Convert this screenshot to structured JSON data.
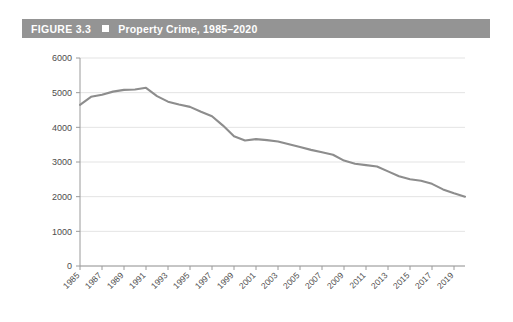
{
  "figure": {
    "number_label": "FIGURE 3.3",
    "bullet_icon": "square-bullet-icon",
    "title": "Property Crime, 1985–2020"
  },
  "colors": {
    "title_bar_background": "#949494",
    "title_text": "#ffffff",
    "line": "#8d8d8d",
    "gridline": "#dcdcdc",
    "axis": "#9a9a9a",
    "tick_text": "#4d4d4d",
    "page_background": "#ffffff"
  },
  "chart_data": {
    "type": "line",
    "title": "Property Crime, 1985–2020",
    "xlabel": "",
    "ylabel": "",
    "ylim": [
      0,
      6000
    ],
    "xlim": [
      1985,
      2020
    ],
    "ytick_values": [
      0,
      1000,
      2000,
      3000,
      4000,
      5000,
      6000
    ],
    "ytick_labels": [
      "0",
      "1000",
      "2000",
      "3000",
      "4000",
      "5000",
      "6000"
    ],
    "xtick_values": [
      1985,
      1987,
      1989,
      1991,
      1993,
      1995,
      1997,
      1999,
      2001,
      2003,
      2005,
      2007,
      2009,
      2011,
      2013,
      2015,
      2017,
      2019
    ],
    "xtick_labels": [
      "1985",
      "1987",
      "1989",
      "1991",
      "1993",
      "1995",
      "1997",
      "1999",
      "2001",
      "2003",
      "2005",
      "2007",
      "2009",
      "2011",
      "2013",
      "2015",
      "2017",
      "2019"
    ],
    "xtick_rotation_deg": 45,
    "grid": true,
    "grid_axis": "y",
    "legend": false,
    "series": [
      {
        "name": "Property Crime Rate",
        "x": [
          1985,
          1986,
          1987,
          1988,
          1989,
          1990,
          1991,
          1992,
          1993,
          1994,
          1995,
          1996,
          1997,
          1998,
          1999,
          2000,
          2001,
          2002,
          2003,
          2004,
          2005,
          2006,
          2007,
          2008,
          2009,
          2010,
          2011,
          2012,
          2013,
          2014,
          2015,
          2016,
          2017,
          2018,
          2019,
          2020
        ],
        "values": [
          4650,
          4880,
          4940,
          5030,
          5080,
          5090,
          5140,
          4900,
          4740,
          4660,
          4590,
          4450,
          4320,
          4050,
          3740,
          3620,
          3660,
          3630,
          3590,
          3510,
          3430,
          3350,
          3280,
          3210,
          3040,
          2950,
          2910,
          2870,
          2730,
          2590,
          2500,
          2460,
          2370,
          2210,
          2100,
          2000
        ]
      }
    ]
  }
}
